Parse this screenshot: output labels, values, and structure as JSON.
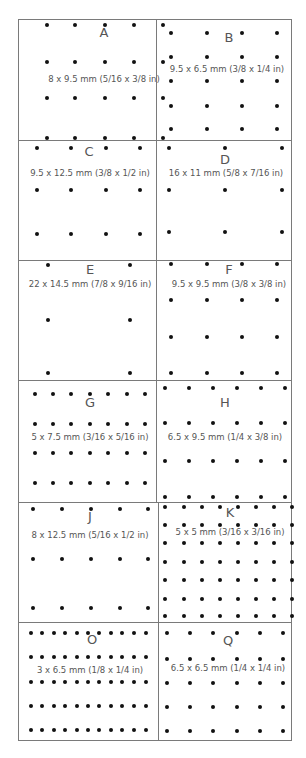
{
  "panels": [
    {
      "id": "A",
      "label": "A",
      "dims": "8 x 9.5 mm (5/16 x 3/8 in)",
      "cols": [
        28,
        56,
        86,
        115,
        144
      ],
      "rows": [
        5,
        42,
        78,
        118
      ],
      "letter": [
        85,
        12
      ],
      "text": [
        85,
        60
      ]
    },
    {
      "id": "B",
      "label": "B",
      "dims": "9.5 x 6.5 mm (3/8 x 1/4 in)",
      "cols": [
        14,
        50,
        85,
        120
      ],
      "rows": [
        13,
        37,
        61,
        86,
        109
      ],
      "letter": [
        72,
        17
      ],
      "text": [
        70,
        50
      ]
    },
    {
      "id": "C",
      "label": "C",
      "dims": "9.5 x 12.5 mm (3/8 x 1/2 in)",
      "cols": [
        18,
        52,
        87,
        121
      ],
      "rows": [
        7,
        49,
        93
      ],
      "letter": [
        70,
        10
      ],
      "text": [
        71,
        33
      ]
    },
    {
      "id": "D",
      "label": "D",
      "dims": "16 x 11 mm (5/8 x 7/16 in)",
      "cols": [
        12,
        68,
        125
      ],
      "rows": [
        7,
        49,
        91
      ],
      "letter": [
        68,
        18
      ],
      "text": [
        69,
        33
      ]
    },
    {
      "id": "E",
      "label": "E",
      "dims": "22 x 14.5 mm (7/8 x 9/16 in)",
      "cols": [
        29,
        111
      ],
      "rows": [
        4,
        59,
        112
      ],
      "letter": [
        71,
        8
      ],
      "text": [
        71,
        24
      ]
    },
    {
      "id": "F",
      "label": "F",
      "dims": "9.5 x 9.5 mm (3/8 x 3/8 in)",
      "cols": [
        14,
        50,
        85,
        120
      ],
      "rows": [
        3,
        39,
        76,
        112
      ],
      "letter": [
        72,
        8
      ],
      "text": [
        72,
        24
      ]
    },
    {
      "id": "G",
      "label": "G",
      "dims": "5 x 7.5 mm (3/16 x 5/16 in)",
      "cols": [
        16,
        34,
        52,
        71,
        89,
        108,
        126
      ],
      "rows": [
        13,
        43,
        72,
        102
      ],
      "letter": [
        71,
        21
      ],
      "text": [
        71,
        57
      ]
    },
    {
      "id": "H",
      "label": "H",
      "dims": "6.5 x 9.5 mm (1/4 x 3/8 in)",
      "cols": [
        8,
        32,
        56,
        80,
        104,
        128
      ],
      "rows": [
        7,
        42,
        80,
        116
      ],
      "letter": [
        68,
        21
      ],
      "text": [
        68,
        57
      ]
    },
    {
      "id": "J",
      "label": "J",
      "dims": "8 x 12.5 mm (5/16 x 1/2 in)",
      "cols": [
        14,
        43,
        72,
        101,
        129
      ],
      "rows": [
        6,
        56,
        105
      ],
      "letter": [
        71,
        13
      ],
      "text": [
        71,
        33
      ]
    },
    {
      "id": "K",
      "label": "K",
      "dims": "5 x 5 mm (3/16 x 3/16 in)",
      "cols": [
        6,
        25,
        43,
        61,
        79,
        97,
        115,
        133
      ],
      "rows": [
        4,
        22,
        40,
        59,
        77,
        96,
        113
      ],
      "letter": [
        71,
        9
      ],
      "text": [
        71,
        30
      ]
    },
    {
      "id": "O",
      "label": "O",
      "dims": "3 x 6.5 mm (1/8 x 1/4 in)",
      "cols": [
        12,
        23,
        35,
        46,
        58,
        69,
        80,
        92,
        103,
        115,
        127
      ],
      "rows": [
        10,
        34,
        59,
        83,
        107
      ],
      "letter": [
        73,
        16
      ],
      "text": [
        71,
        48
      ]
    },
    {
      "id": "Q",
      "label": "Q",
      "dims": "6.5 x 6.5 mm (1/4 x 1/4 in)",
      "cols": [
        8,
        31,
        54,
        78,
        101,
        124
      ],
      "rows": [
        10,
        36,
        60,
        84,
        108
      ],
      "letter": [
        69,
        17
      ],
      "text": [
        69,
        46
      ]
    }
  ]
}
